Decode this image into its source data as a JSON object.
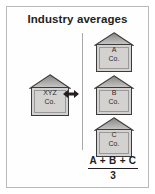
{
  "figure": {
    "title": "Industry averages",
    "background_color": "#ffffff",
    "frame_color": "#b9b9b9",
    "text_color": "#231f20"
  },
  "subject": {
    "name": "house-xyz",
    "line1": "XYZ",
    "line2": "Co.",
    "roof_color_top": "#8d8b89",
    "roof_color_bottom": "#c9c7c5",
    "body_color": "#d4d2d0"
  },
  "comparator": {
    "icon": "double-headed-arrow-icon",
    "color": "#231f20"
  },
  "divider": {
    "color": "#a8a8a8"
  },
  "peers": [
    {
      "name": "house-a",
      "line1": "A",
      "line2": "Co."
    },
    {
      "name": "house-b",
      "line1": "B",
      "line2": "Co."
    },
    {
      "name": "house-c",
      "line1": "C",
      "line2": "Co."
    }
  ],
  "formula": {
    "numerator": "A + B + C",
    "denominator": "3"
  }
}
